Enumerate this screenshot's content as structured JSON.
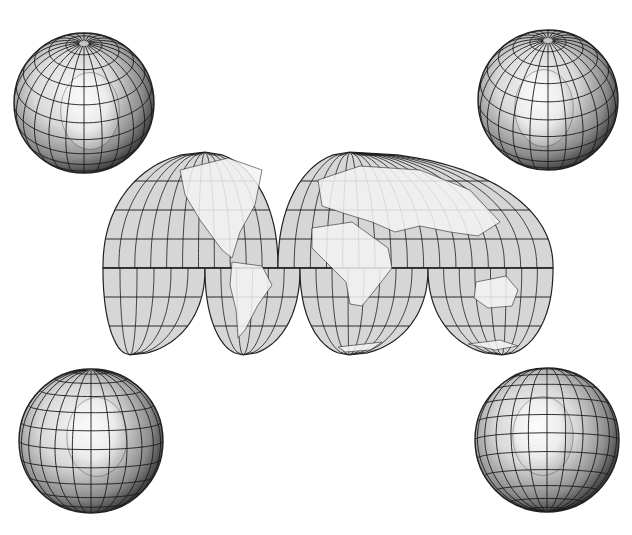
{
  "figure": {
    "type": "map-illustration",
    "background": "#ffffff",
    "line_color": "#1a1a1a",
    "land_color": "#f4f4f4",
    "ocean_color_map": "#d6d6d6",
    "globe_shade_light": "#f2f2f2",
    "globe_shade_dark": "#4a4a4a"
  },
  "globes": [
    {
      "id": "globe-north-america",
      "position": "top-left",
      "center": [
        84,
        103
      ],
      "radius": 70,
      "view": "North pole tilted, North America"
    },
    {
      "id": "globe-asia",
      "position": "top-right",
      "center": [
        548,
        100
      ],
      "radius": 70,
      "view": "North pole tilted, Eurasia"
    },
    {
      "id": "globe-south-america",
      "position": "bottom-left",
      "center": [
        91,
        441
      ],
      "radius": 72,
      "view": "South America"
    },
    {
      "id": "globe-australia",
      "position": "bottom-right",
      "center": [
        547,
        440
      ],
      "radius": 72,
      "view": "Australia / Oceania"
    }
  ],
  "map": {
    "projection": "interrupted homolosine",
    "bounds": {
      "left": 103,
      "top": 152,
      "right": 553,
      "bottom": 355
    },
    "equator_y": 268,
    "lobes_north": [
      {
        "name": "north-americas",
        "x0": 103,
        "x1": 278,
        "peak_x": 205
      },
      {
        "name": "north-eurasia-africa",
        "x0": 278,
        "x1": 553,
        "peak_x": 350
      }
    ],
    "lobes_south": [
      {
        "name": "south-pacific-east",
        "x0": 103,
        "x1": 205,
        "tip_x": 130
      },
      {
        "name": "south-america",
        "x0": 205,
        "x1": 300,
        "tip_x": 243
      },
      {
        "name": "south-africa",
        "x0": 300,
        "x1": 428,
        "tip_x": 349
      },
      {
        "name": "south-oceania",
        "x0": 428,
        "x1": 553,
        "tip_x": 502
      }
    ],
    "graticule_lat_step_px": 29
  }
}
